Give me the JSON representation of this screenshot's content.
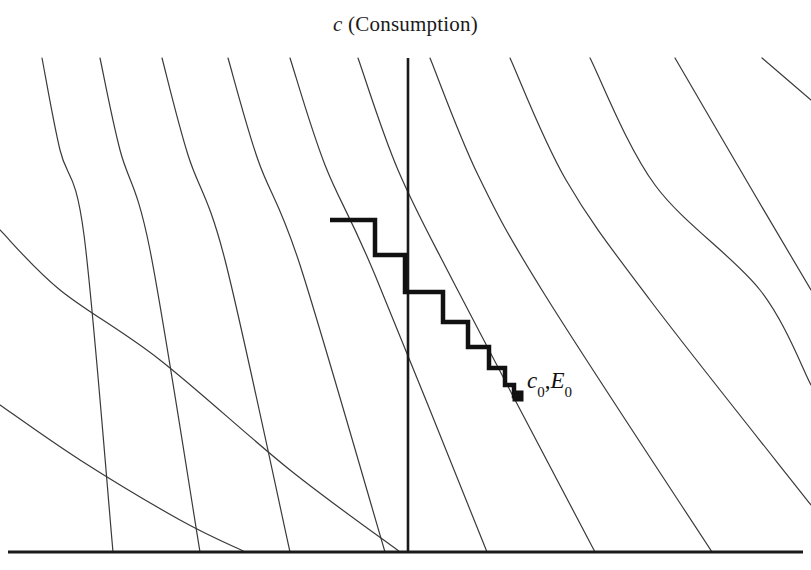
{
  "figure": {
    "title_variable": "c",
    "title_text": " (Consumption)",
    "background_color": "#ffffff",
    "width": 811,
    "height": 570
  },
  "labels": {
    "equilibrium_variable_1": "c",
    "equilibrium_sub_1": "0",
    "equilibrium_separator": ",",
    "equilibrium_variable_2": "E",
    "equilibrium_sub_2": "0"
  },
  "chart_data": {
    "type": "line",
    "title": "c (Consumption)",
    "xlabel": "",
    "ylabel": "c (Consumption)",
    "grid": false,
    "legend": "none",
    "axes": {
      "x_axis": {
        "y": 552,
        "x_start": 8,
        "x_end": 803,
        "color": "#1a1a1a",
        "width": 3
      },
      "vertical_line": {
        "x": 408,
        "y_start": 58,
        "y_end": 552,
        "color": "#1a1a1a",
        "width": 2.6
      }
    },
    "indifference_curves": {
      "count": 11,
      "color": "#3a3a3a",
      "line_width": 1.2,
      "description": "Convex decreasing indifference curves sweeping from upper-left to lower-right",
      "curves": [
        {
          "id": 1,
          "points": [
            [
              42,
              58
            ],
            [
              60,
              150
            ],
            [
              84,
              235
            ],
            [
              113,
              552
            ]
          ]
        },
        {
          "id": 2,
          "points": [
            [
              100,
              58
            ],
            [
              120,
              150
            ],
            [
              150,
              250
            ],
            [
              200,
              552
            ]
          ]
        },
        {
          "id": 3,
          "points": [
            [
              162,
              58
            ],
            [
              188,
              155
            ],
            [
              225,
              260
            ],
            [
              290,
              552
            ]
          ]
        },
        {
          "id": 4,
          "points": [
            [
              228,
              58
            ],
            [
              258,
              160
            ],
            [
              300,
              265
            ],
            [
              385,
              552
            ]
          ]
        },
        {
          "id": 5,
          "points": [
            [
              290,
              58
            ],
            [
              325,
              165
            ],
            [
              375,
              275
            ],
            [
              487,
              552
            ]
          ]
        },
        {
          "id": 6,
          "points": [
            [
              358,
              58
            ],
            [
              398,
              170
            ],
            [
              455,
              285
            ],
            [
              595,
              552
            ]
          ]
        },
        {
          "id": 7,
          "points": [
            [
              430,
              58
            ],
            [
              478,
              175
            ],
            [
              545,
              295
            ],
            [
              712,
              552
            ]
          ]
        },
        {
          "id": 8,
          "points": [
            [
              510,
              58
            ],
            [
              566,
              180
            ],
            [
              650,
              300
            ],
            [
              811,
              505
            ]
          ]
        },
        {
          "id": 9,
          "points": [
            [
              590,
              58
            ],
            [
              655,
              185
            ],
            [
              760,
              290
            ],
            [
              811,
              385
            ]
          ]
        },
        {
          "id": 10,
          "points": [
            [
              675,
              58
            ],
            [
              752,
              190
            ],
            [
              811,
              290
            ]
          ]
        },
        {
          "id": 11,
          "points": [
            [
              762,
              58
            ],
            [
              811,
              100
            ]
          ]
        },
        {
          "id": 12,
          "points": [
            [
              0,
              230
            ],
            [
              60,
              290
            ],
            [
              160,
              360
            ],
            [
              290,
              470
            ],
            [
              400,
              552
            ]
          ]
        },
        {
          "id": 13,
          "points": [
            [
              0,
              405
            ],
            [
              80,
              460
            ],
            [
              180,
              520
            ],
            [
              245,
              552
            ]
          ]
        }
      ]
    },
    "staircase_path": {
      "color": "#111111",
      "line_width": 4.5,
      "description": "Convergent staircase (cobweb) path descending toward the steady state",
      "vertices": [
        [
          330,
          220
        ],
        [
          375,
          220
        ],
        [
          375,
          255
        ],
        [
          405,
          255
        ],
        [
          405,
          292
        ],
        [
          443,
          292
        ],
        [
          443,
          322
        ],
        [
          468,
          322
        ],
        [
          468,
          347
        ],
        [
          489,
          347
        ],
        [
          489,
          368
        ],
        [
          505,
          368
        ],
        [
          505,
          385
        ],
        [
          514,
          385
        ],
        [
          514,
          396
        ],
        [
          520,
          396
        ]
      ]
    },
    "marker": {
      "type": "filled-square",
      "x": 518,
      "y": 396,
      "size": 11,
      "color": "#111111",
      "label": "c0,E0"
    }
  }
}
